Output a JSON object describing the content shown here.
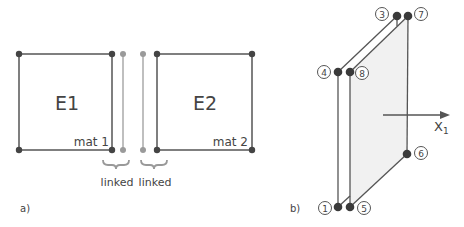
{
  "panel_a": {
    "label": "a)",
    "element1": {
      "name": "E1",
      "material": "mat 1"
    },
    "element2": {
      "name": "E2",
      "material": "mat 2"
    },
    "link_labels": [
      "linked",
      "linked"
    ]
  },
  "panel_b": {
    "label": "b)",
    "nodes": [
      "1",
      "2",
      "3",
      "4",
      "5",
      "6",
      "7",
      "8"
    ],
    "node_labels": {
      "n1": "1",
      "n3": "3",
      "n4": "4",
      "n5": "5",
      "n6": "6",
      "n7": "7",
      "n8": "8"
    },
    "axis_label": "X",
    "axis_subscript": "1"
  },
  "colors": {
    "dark_line": "#555555",
    "light_line": "#a8a8a8",
    "dark_node": "#3a3a3a",
    "light_node": "#9a9a9a",
    "face_fill": "#f1f1f1"
  }
}
